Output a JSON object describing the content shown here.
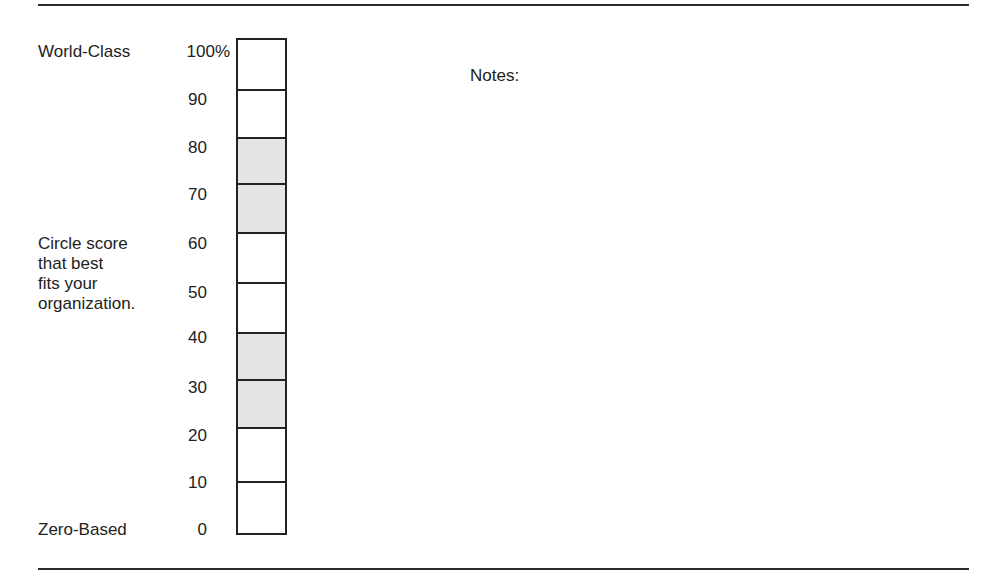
{
  "form": {
    "top_label": "World-Class",
    "bottom_label": "Zero-Based",
    "instructions": [
      "Circle score",
      "that best",
      "fits your",
      "organization."
    ],
    "notes_label": "Notes:"
  },
  "scale": {
    "tick_labels": [
      "100%",
      "90",
      "80",
      "70",
      "60",
      "50",
      "40",
      "30",
      "20",
      "10",
      "0"
    ],
    "cells": [
      {
        "top": 0,
        "height": 51,
        "shaded": false
      },
      {
        "top": 51,
        "height": 48,
        "shaded": false
      },
      {
        "top": 99,
        "height": 46,
        "shaded": true
      },
      {
        "top": 145,
        "height": 49,
        "shaded": true
      },
      {
        "top": 194,
        "height": 50,
        "shaded": false
      },
      {
        "top": 244,
        "height": 50,
        "shaded": false
      },
      {
        "top": 294,
        "height": 47,
        "shaded": true
      },
      {
        "top": 341,
        "height": 48,
        "shaded": true
      },
      {
        "top": 389,
        "height": 54,
        "shaded": false
      },
      {
        "top": 443,
        "height": 52,
        "shaded": false
      }
    ],
    "colors": {
      "border": "#222222",
      "shade": "#e4e4e4"
    }
  }
}
